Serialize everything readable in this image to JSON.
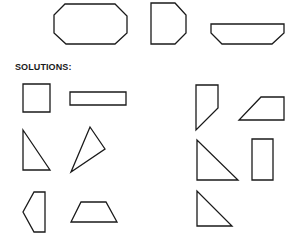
{
  "solutions_label": "SOLUTIONS:",
  "colors": {
    "stroke": "#1a1a1a",
    "background": "#ffffff"
  },
  "puzzles": [
    {
      "name": "octagon",
      "points": "65,4 115,4 127,16 127,33 115,44 66,44 54,33 54,15"
    },
    {
      "name": "d-shape",
      "points": "151,3 175,3 186,15 186,33 175,44 151,44"
    },
    {
      "name": "flat-hexagon",
      "points": "211,24 284,24 284,33 272,44 222,44 211,33"
    }
  ],
  "solutions": [
    {
      "name": "square",
      "points": "23,84 50,84 50,112 23,112"
    },
    {
      "name": "long-rectangle",
      "points": "70,92 126,92 126,105 70,105"
    },
    {
      "name": "right-triangle-left",
      "points": "23,130 23,170 50,170"
    },
    {
      "name": "slanted-triangle",
      "points": "90,127 105,149 71,172"
    },
    {
      "name": "pentagon",
      "points": "34,192 45,192 45,232 34,232 23,212"
    },
    {
      "name": "trapezoid-bottom",
      "points": "81,202 106,202 117,222 71,222"
    },
    {
      "name": "quad-right",
      "points": "196,85 218,85 218,108 196,130"
    },
    {
      "name": "trapezoid-right",
      "points": "261,97 284,97 284,120 239,120"
    },
    {
      "name": "large-right-triangle",
      "points": "197,140 197,180 238,180"
    },
    {
      "name": "tall-rectangle",
      "points": "252,139 273,139 273,180 252,180"
    },
    {
      "name": "small-right-triangle",
      "points": "197,191 197,226 232,226"
    }
  ]
}
